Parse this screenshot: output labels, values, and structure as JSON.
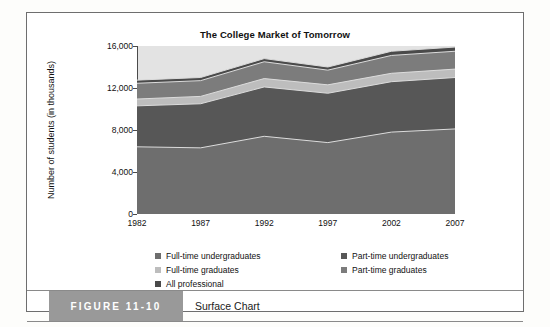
{
  "figure": {
    "number_label": "FIGURE 11-10",
    "caption": "Surface Chart"
  },
  "chart_data": {
    "type": "area",
    "title": "The College Market of Tomorrow",
    "xlabel": "",
    "ylabel": "Number of students (in thousands)",
    "stacked": true,
    "grid": false,
    "legend_position": "bottom",
    "x": [
      1982,
      1987,
      1992,
      1997,
      2002,
      2007
    ],
    "categories": [
      "1982",
      "1987",
      "1992",
      "1997",
      "2002",
      "2007"
    ],
    "xticklabels": [
      "1982",
      "1987",
      "1992",
      "1997",
      "2002",
      "2007"
    ],
    "yticklabels": [
      "0",
      "4,000",
      "8,000",
      "12,000",
      "16,000"
    ],
    "ytickvalues": [
      0,
      4000,
      8000,
      12000,
      16000
    ],
    "ylim": [
      0,
      16000
    ],
    "xlim": [
      1982,
      2007
    ],
    "series": [
      {
        "name": "Full-time undergraduates",
        "color": "#6e6e6e",
        "values": [
          6400,
          6300,
          7400,
          6800,
          7800,
          8100
        ]
      },
      {
        "name": "Part-time undergraduates",
        "color": "#575757",
        "values": [
          3900,
          4200,
          4700,
          4700,
          4800,
          4900
        ]
      },
      {
        "name": "Full-time graduates",
        "color": "#bdbdbd",
        "values": [
          650,
          700,
          800,
          800,
          800,
          800
        ]
      },
      {
        "name": "Part-time graduates",
        "color": "#7c7c7c",
        "values": [
          1500,
          1500,
          1600,
          1400,
          1700,
          1700
        ]
      },
      {
        "name": "All professional",
        "color": "#4a4a4a",
        "values": [
          300,
          300,
          300,
          300,
          400,
          400
        ]
      }
    ],
    "stack_tops": [
      [
        6400,
        6300,
        7400,
        6800,
        7800,
        8100
      ],
      [
        10300,
        10500,
        12100,
        11500,
        12600,
        13000
      ],
      [
        10950,
        11200,
        12900,
        12300,
        13400,
        13800
      ],
      [
        12450,
        12700,
        14500,
        13700,
        15100,
        15500
      ],
      [
        12750,
        13000,
        14800,
        14000,
        15500,
        15900
      ]
    ],
    "legend": [
      {
        "label": "Full-time undergraduates",
        "color": "#6e6e6e"
      },
      {
        "label": "Full-time graduates",
        "color": "#bdbdbd"
      },
      {
        "label": "All professional",
        "color": "#4a4a4a"
      },
      {
        "label": "Part-time undergraduates",
        "color": "#575757"
      },
      {
        "label": "Part-time graduates",
        "color": "#7c7c7c"
      }
    ],
    "plot_background": "#e3e3e3",
    "axis_color": "#4a4a4a"
  }
}
